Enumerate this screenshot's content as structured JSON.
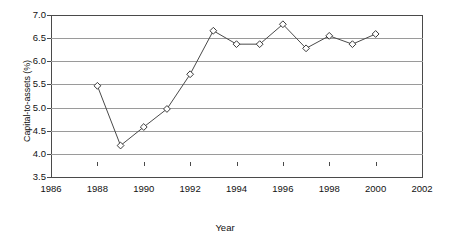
{
  "chart_data": {
    "type": "line",
    "title": "",
    "subtitle": "",
    "xlabel": "Year",
    "ylabel": "Capital-to-assets (%)",
    "xlim": [
      1986,
      2002
    ],
    "ylim": [
      3.5,
      7.0
    ],
    "xticks": [
      1986,
      1988,
      1990,
      1992,
      1994,
      1996,
      1998,
      2000,
      2002
    ],
    "yticks": [
      3.5,
      4.0,
      4.5,
      5.0,
      5.5,
      6.0,
      6.5,
      7.0
    ],
    "xtick_labels": [
      "1986",
      "1988",
      "1990",
      "1992",
      "1994",
      "1996",
      "1998",
      "2000",
      "2002"
    ],
    "ytick_labels": [
      "3.5",
      "4.0",
      "4.5",
      "5.0",
      "5.5",
      "6.0",
      "6.5",
      "7.0"
    ],
    "grid": true,
    "grid_axis": "y",
    "legend": false,
    "legend_position": "none",
    "marker": "diamond",
    "marker_facecolor": "#ffffff",
    "marker_edgecolor": "#3a3a3a",
    "line_color": "#4a4a4a",
    "grid_color": "#9a9a9a",
    "axis_color": "#4a4a4a",
    "background": "#ffffff",
    "x": [
      1988,
      1989,
      1990,
      1991,
      1992,
      1993,
      1994,
      1995,
      1996,
      1997,
      1998,
      1999,
      2000
    ],
    "values": [
      5.47,
      4.18,
      4.58,
      4.97,
      5.72,
      6.66,
      6.37,
      6.37,
      6.8,
      6.28,
      6.55,
      6.37,
      6.59
    ],
    "series": [
      {
        "name": "Capital-to-assets",
        "x": [
          1988,
          1989,
          1990,
          1991,
          1992,
          1993,
          1994,
          1995,
          1996,
          1997,
          1998,
          1999,
          2000
        ],
        "values": [
          5.47,
          4.18,
          4.58,
          4.97,
          5.72,
          6.66,
          6.37,
          6.37,
          6.8,
          6.28,
          6.55,
          6.37,
          6.59
        ]
      }
    ]
  }
}
